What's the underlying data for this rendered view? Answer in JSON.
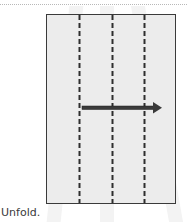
{
  "diagram": {
    "caption": "Unfold.",
    "paper": {
      "fill": "#ececec",
      "border": "#3a3a3a"
    },
    "fold_lines": [
      {
        "type": "valley-dashed",
        "x": 79
      },
      {
        "type": "valley-dashed",
        "x": 112
      },
      {
        "type": "valley-dashed",
        "x": 144
      }
    ],
    "arrow": {
      "direction": "right",
      "meaning": "unfold",
      "color": "#3a3a3a"
    }
  }
}
